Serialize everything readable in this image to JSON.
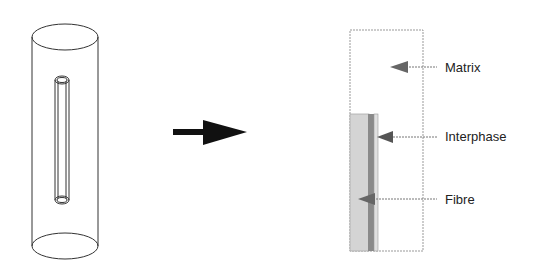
{
  "diagram": {
    "left_figure": "cylinder-with-embedded-fibre",
    "transition": "arrow-right",
    "right_figure": "axisymmetric-cross-section",
    "labels": {
      "matrix": "Matrix",
      "interphase": "Interphase",
      "fibre": "Fibre"
    },
    "colors": {
      "outline": "#333333",
      "fibre_fill": "#d4d4d4",
      "interphase_fill": "#8a8a8a",
      "arrow": "#111111",
      "pointer": "#666666"
    }
  }
}
